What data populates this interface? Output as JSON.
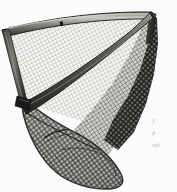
{
  "image": {
    "subject": "fishing-landing-net",
    "description": "Black and white product photograph of a triangular scoop fishing landing net with knotted mesh netting stretched across a dark metal frame",
    "orientation": "portrait",
    "width": 177,
    "height": 192,
    "background_color": "#ffffff",
    "palette": {
      "background": "#ffffff",
      "frame_dark": "#2b2b2b",
      "frame_mid": "#5a5a5a",
      "frame_highlight": "#c9c9c4",
      "mesh_light": "#d8d8d4",
      "mesh_mid": "#9a9a96",
      "mesh_dark": "#4a4a4a",
      "shadow": "#1c1c1c"
    },
    "parts": [
      {
        "name": "top-rim-bar",
        "note": "Curved dark frame bar arcing across the top from the left edge down to the upper right"
      },
      {
        "name": "left-frame-rail",
        "note": "Dark vertical-diagonal frame rail down the left side"
      },
      {
        "name": "diagonal-frame-bar",
        "note": "Thick diagonal spreader bar running from lower left up to the upper right"
      },
      {
        "name": "upper-mesh-panel",
        "note": "Light gray fine diamond knotted mesh in the upper triangular opening"
      },
      {
        "name": "lower-mesh-bag",
        "note": "Darker hanging mesh bag below the frame"
      },
      {
        "name": "bag-seam-hoop",
        "note": "Curved seam line visible through the mesh near the bottom of the bag"
      },
      {
        "name": "corner-joint",
        "note": "Frame joint fitting at the lower left corner"
      }
    ]
  },
  "caption": {
    "lines": [
      "J",
      "d",
      "wit"
    ],
    "note": "Three lines of tiny italic serif text cropped off at the right edge of the image"
  }
}
